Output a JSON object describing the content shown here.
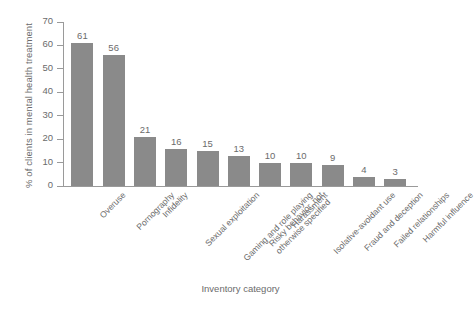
{
  "chart_data": {
    "type": "bar",
    "title": "",
    "xlabel": "Inventory category",
    "ylabel": "% of clients in mental health treatment",
    "ylim": [
      0,
      70
    ],
    "ytick_values": [
      0,
      10,
      20,
      30,
      40,
      50,
      60,
      70
    ],
    "grid": false,
    "legend": false,
    "bar_color": "#8a8a8a",
    "axis_color": "#9a9a9a",
    "text_color": "#6b6b6b",
    "categories": [
      "Overuse",
      "Pornography",
      "Infidelity",
      "Sexual exploitation",
      "Gaming and role playing",
      "Risky behavior, not otherwise specified",
      "Harassment",
      "Isolative-avoidant use",
      "Fraud and deception",
      "Failed relationships",
      "Harmful influence"
    ],
    "category_lines": [
      [
        "Overuse"
      ],
      [
        "Pornography"
      ],
      [
        "Infidelity"
      ],
      [
        "Sexual exploitation"
      ],
      [
        "Gaming and role playing"
      ],
      [
        "Risky behavior, not",
        "otherwise specified"
      ],
      [
        "Harassment"
      ],
      [
        "Isolative-avoidant use"
      ],
      [
        "Fraud and deception"
      ],
      [
        "Failed relationships"
      ],
      [
        "Harmful influence"
      ]
    ],
    "values": [
      61,
      56,
      21,
      16,
      15,
      13,
      10,
      10,
      9,
      4,
      3
    ]
  }
}
